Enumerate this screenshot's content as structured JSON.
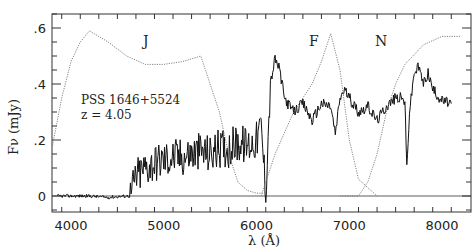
{
  "chart_data": {
    "type": "line",
    "title": "",
    "xlabel": "λ (Å)",
    "ylabel": "Fν (mJy)",
    "xlim": [
      3800,
      8200
    ],
    "ylim": [
      -0.04,
      0.65
    ],
    "grid": false,
    "x_ticks": [
      4000,
      5000,
      6000,
      7000,
      8000
    ],
    "x_tick_labels": [
      "4000",
      "5000",
      "6000",
      "7000",
      "8000"
    ],
    "y_ticks": [
      0,
      0.2,
      0.4,
      0.6
    ],
    "y_tick_labels": [
      "0",
      ".2",
      ".4",
      ".6"
    ],
    "annotations": {
      "object": "PSS 1646+5524",
      "redshift": "z = 4.05",
      "bands": [
        {
          "label": "J",
          "x": 5000
        },
        {
          "label": "F",
          "x": 6800
        },
        {
          "label": "N",
          "x": 7500
        }
      ]
    },
    "series": [
      {
        "name": "spectrum",
        "style": "solid",
        "x": [
          3850,
          4000,
          4200,
          4400,
          4600,
          4640,
          4700,
          4800,
          4900,
          5000,
          5100,
          5200,
          5300,
          5400,
          5500,
          5600,
          5700,
          5800,
          5900,
          6000,
          6050,
          6100,
          6150,
          6200,
          6250,
          6300,
          6400,
          6500,
          6600,
          6700,
          6800,
          6850,
          6900,
          6950,
          7000,
          7100,
          7200,
          7300,
          7400,
          7500,
          7550,
          7600,
          7620,
          7650,
          7700,
          7750,
          7800,
          7850,
          7900,
          8000,
          8100
        ],
        "y": [
          0.0,
          0.0,
          0.0,
          -0.005,
          0.0,
          0.0,
          0.07,
          0.1,
          0.12,
          0.13,
          0.14,
          0.14,
          0.15,
          0.16,
          0.15,
          0.17,
          0.17,
          0.19,
          0.18,
          0.2,
          0.25,
          0.02,
          0.4,
          0.49,
          0.45,
          0.35,
          0.3,
          0.33,
          0.27,
          0.33,
          0.32,
          0.22,
          0.35,
          0.38,
          0.35,
          0.3,
          0.32,
          0.27,
          0.32,
          0.35,
          0.35,
          0.34,
          0.1,
          0.3,
          0.44,
          0.46,
          0.4,
          0.44,
          0.38,
          0.34,
          0.33
        ]
      },
      {
        "name": "J filter",
        "style": "dotted",
        "x": [
          3800,
          3900,
          4000,
          4100,
          4200,
          4400,
          4600,
          4800,
          5000,
          5200,
          5400,
          5600,
          5700,
          5800,
          5900,
          6000,
          6100
        ],
        "y": [
          0.18,
          0.35,
          0.48,
          0.55,
          0.59,
          0.55,
          0.5,
          0.47,
          0.47,
          0.48,
          0.5,
          0.3,
          0.15,
          0.05,
          0.02,
          0.01,
          0.01
        ]
      },
      {
        "name": "F filter",
        "style": "dotted",
        "x": [
          6050,
          6200,
          6400,
          6600,
          6700,
          6800,
          6900,
          7000,
          7100,
          7200,
          7300
        ],
        "y": [
          0.0,
          0.15,
          0.3,
          0.4,
          0.48,
          0.58,
          0.45,
          0.2,
          0.06,
          0.03,
          0.0
        ]
      },
      {
        "name": "N filter",
        "style": "dotted",
        "x": [
          6900,
          7100,
          7200,
          7300,
          7400,
          7500,
          7600,
          7800,
          8000,
          8200
        ],
        "y": [
          0.0,
          0.0,
          0.05,
          0.15,
          0.3,
          0.4,
          0.47,
          0.54,
          0.57,
          0.57
        ]
      }
    ]
  }
}
